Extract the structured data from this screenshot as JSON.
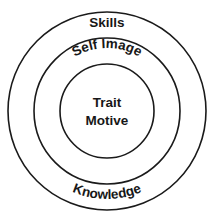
{
  "diagram": {
    "type": "concentric-circles",
    "background_color": "#ffffff",
    "stroke_color": "#1a1a1a",
    "text_color": "#171717",
    "rings": [
      {
        "id": "outer",
        "label": "Skills",
        "secondary_label": "Knowledge",
        "label_position": "top",
        "secondary_label_position": "bottom",
        "radius": 99,
        "center_x": 107,
        "center_y": 111
      },
      {
        "id": "middle",
        "label": "Self Image",
        "label_position": "top",
        "radius": 73,
        "center_x": 107,
        "center_y": 111
      },
      {
        "id": "inner",
        "label_line_1": "Trait",
        "label_line_2": "Motive",
        "label_position": "center",
        "radius": 47,
        "center_x": 107,
        "center_y": 111
      }
    ]
  }
}
